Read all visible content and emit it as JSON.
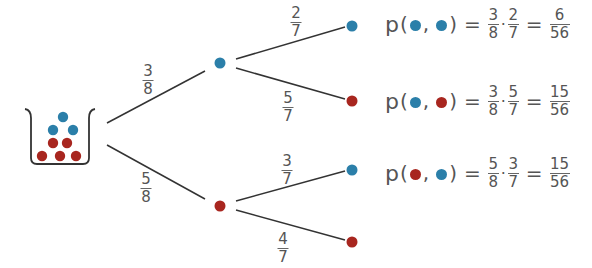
{
  "colors": {
    "blue": "#2b7fa9",
    "red": "#a8261f",
    "line": "#333333",
    "text": "#555555"
  },
  "urn": {
    "balls_blue": 3,
    "balls_red": 5
  },
  "first_stage": {
    "blue_branch": {
      "num": "3",
      "den": "8"
    },
    "red_branch": {
      "num": "5",
      "den": "8"
    }
  },
  "second_stage": {
    "after_blue": {
      "blue": {
        "num": "2",
        "den": "7"
      },
      "red": {
        "num": "5",
        "den": "7"
      }
    },
    "after_red": {
      "blue": {
        "num": "3",
        "den": "7"
      },
      "red": {
        "num": "4",
        "den": "7"
      }
    }
  },
  "formulas": [
    {
      "p": "p",
      "open": "(",
      "comma": ",",
      "close": ")",
      "eq1": "=",
      "dot": "·",
      "eq2": "=",
      "f1": {
        "num": "3",
        "den": "8"
      },
      "f2": {
        "num": "2",
        "den": "7"
      },
      "res": {
        "num": "6",
        "den": "56"
      },
      "first": "blue",
      "second": "blue"
    },
    {
      "p": "p",
      "open": "(",
      "comma": ",",
      "close": ")",
      "eq1": "=",
      "dot": "·",
      "eq2": "=",
      "f1": {
        "num": "3",
        "den": "8"
      },
      "f2": {
        "num": "5",
        "den": "7"
      },
      "res": {
        "num": "15",
        "den": "56"
      },
      "first": "blue",
      "second": "red"
    },
    {
      "p": "p",
      "open": "(",
      "comma": ",",
      "close": ")",
      "eq1": "=",
      "dot": "·",
      "eq2": "=",
      "f1": {
        "num": "5",
        "den": "8"
      },
      "f2": {
        "num": "3",
        "den": "7"
      },
      "res": {
        "num": "15",
        "den": "56"
      },
      "first": "red",
      "second": "blue"
    }
  ]
}
